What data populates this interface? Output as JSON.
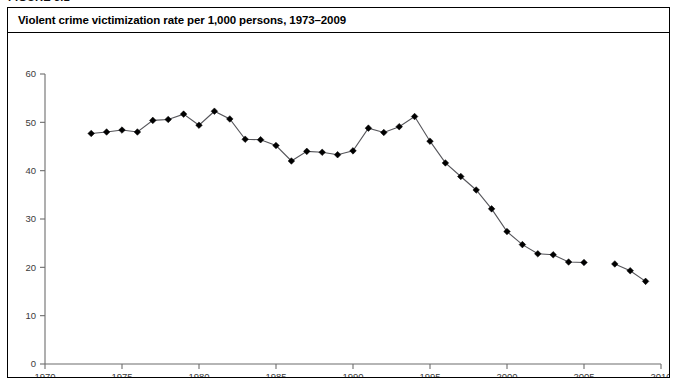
{
  "figure": {
    "label": "FIGURE 3.1",
    "title": "Violent crime victimization rate per 1,000 persons, 1973–2009",
    "border_color": "#000000",
    "background_color": "#ffffff"
  },
  "chart_data": {
    "type": "line",
    "title": "Violent crime victimization rate per 1,000 persons, 1973–2009",
    "xlabel": "",
    "ylabel": "",
    "xlim": [
      1970,
      2010
    ],
    "ylim": [
      0,
      60
    ],
    "xticks": [
      1970,
      1975,
      1980,
      1985,
      1990,
      1995,
      2000,
      2005,
      2010
    ],
    "xtick_labels": [
      "1970",
      "1975",
      "1980",
      "1985",
      "1990",
      "1995",
      "2000",
      "2005",
      "2010"
    ],
    "yticks": [
      0,
      10,
      20,
      30,
      40,
      50,
      60
    ],
    "ytick_labels": [
      "0",
      "10",
      "20",
      "30",
      "40",
      "50",
      "60"
    ],
    "grid": false,
    "legend": null,
    "legend_position": "none",
    "marker": "diamond",
    "marker_color": "#000000",
    "line_color": "#55555a",
    "gap_years": [
      2006
    ],
    "x": [
      1973,
      1974,
      1975,
      1976,
      1977,
      1978,
      1979,
      1980,
      1981,
      1982,
      1983,
      1984,
      1985,
      1986,
      1987,
      1988,
      1989,
      1990,
      1991,
      1992,
      1993,
      1994,
      1995,
      1996,
      1997,
      1998,
      1999,
      2000,
      2001,
      2002,
      2003,
      2004,
      2005,
      2007,
      2008,
      2009
    ],
    "values": [
      47.7,
      48.0,
      48.4,
      48.0,
      50.4,
      50.6,
      51.7,
      49.4,
      52.3,
      50.7,
      46.5,
      46.4,
      45.2,
      42.0,
      44.0,
      43.8,
      43.3,
      44.1,
      48.8,
      47.9,
      49.1,
      51.2,
      46.1,
      41.6,
      38.8,
      36.0,
      32.1,
      27.4,
      24.7,
      22.8,
      22.6,
      21.1,
      21.0,
      20.7,
      19.3,
      17.1
    ]
  }
}
